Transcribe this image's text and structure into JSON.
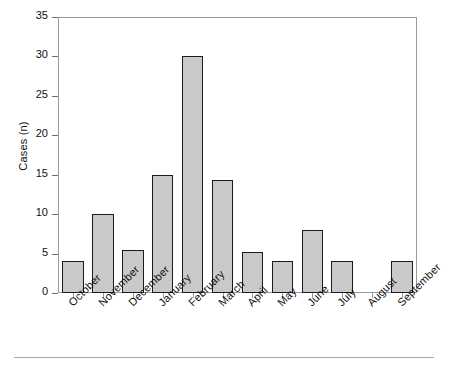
{
  "chart_data": {
    "type": "bar",
    "title": "",
    "subtitle": "",
    "xlabel": "",
    "ylabel": "Cases (n)",
    "categories": [
      "October",
      "November",
      "December",
      "January",
      "February",
      "March",
      "April",
      "May",
      "June",
      "July",
      "August",
      "September"
    ],
    "values": [
      4.0,
      10.0,
      5.4,
      15.0,
      30.0,
      14.3,
      5.2,
      4.1,
      8.0,
      4.1,
      0,
      4.1
    ],
    "series": [
      {
        "name": "Cases",
        "values": [
          4.0,
          10.0,
          5.4,
          15.0,
          30.0,
          14.3,
          5.2,
          4.1,
          8.0,
          4.1,
          0,
          4.1
        ]
      }
    ],
    "ylim": [
      0,
      35
    ],
    "yticks": [
      0,
      5,
      10,
      15,
      20,
      25,
      30,
      35
    ],
    "ytick_labels": [
      "0",
      "5",
      "10",
      "15",
      "20",
      "25",
      "30",
      "35"
    ],
    "grid": false,
    "legend": false,
    "legend_position": "none",
    "bar_fill_color": "#c9c9c9",
    "bar_edge_color": "#1c1c1c",
    "axis_color": "#9a9a9a",
    "background_color": "#ffffff",
    "xtick_label_rotation": -45
  },
  "figure": {
    "bottom_rule": true
  }
}
